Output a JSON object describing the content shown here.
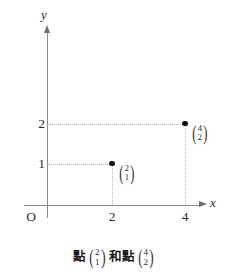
{
  "figure": {
    "background_color": "#ffffff",
    "axis_color": "#8a8a8a",
    "grid_color": "#b9b9b9",
    "point_color": "#111111",
    "origin_label": "O",
    "x_axis_label": "x",
    "y_axis_label": "y",
    "caption": {
      "text_before": "點",
      "text_middle": "和點",
      "first_vector": {
        "top": "2",
        "bottom": "1"
      },
      "second_vector": {
        "top": "4",
        "bottom": "2"
      }
    }
  },
  "chart_data": {
    "type": "scatter",
    "title": "",
    "xlabel": "x",
    "ylabel": "y",
    "xlim": [
      0,
      4.6
    ],
    "ylim": [
      0,
      2.9
    ],
    "grid": true,
    "legend": "none",
    "x_ticks": [
      "2",
      "4"
    ],
    "y_ticks": [
      "1",
      "2"
    ],
    "x_tick_values": [
      2,
      4
    ],
    "y_tick_values": [
      1,
      2
    ],
    "points": [
      {
        "name": "point-2-1",
        "x": 2,
        "y": 1,
        "label_top": "2",
        "label_bottom": "1",
        "guide_lines": [
          "horizontal-to-y-axis",
          "vertical-to-x-axis"
        ]
      },
      {
        "name": "point-4-2",
        "x": 4,
        "y": 2,
        "label_top": "4",
        "label_bottom": "2",
        "guide_lines": [
          "horizontal-to-y-axis",
          "vertical-to-x-axis"
        ]
      }
    ],
    "annotations": [
      "點 (2,1) 和點 (4,2)"
    ]
  }
}
